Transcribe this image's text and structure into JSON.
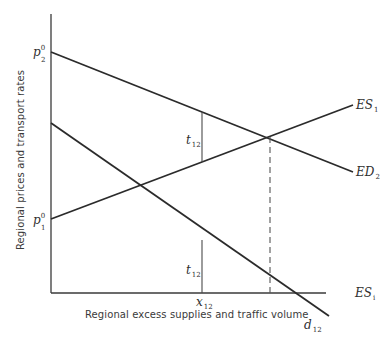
{
  "figure": {
    "y_axis_label": "Regional prices and transport rates",
    "x_axis_label": "Regional excess supplies and traffic volume",
    "price_labels": {
      "p2_base": "p",
      "p2_sub": "2",
      "p2_sup": "0",
      "p1_base": "p",
      "p1_sub": "1",
      "p1_sup": "0"
    },
    "curve_labels": {
      "es1_base": "ES",
      "es1_sub": "1",
      "ed2_base": "ED",
      "ed2_sub": "2",
      "esi_base": "ES",
      "esi_sub": "i",
      "d12_base": "d",
      "d12_sub": "12"
    },
    "rate_labels": {
      "t_upper_base": "t",
      "t_upper_sub": "12",
      "t_lower_base": "t",
      "t_lower_sub": "12"
    },
    "volume_label": {
      "base": "x",
      "sub": "12"
    },
    "colors": {
      "line": "#2b2b2b",
      "thin": "#4a4a4a",
      "dashed": "#555555",
      "background": "#ffffff"
    }
  }
}
